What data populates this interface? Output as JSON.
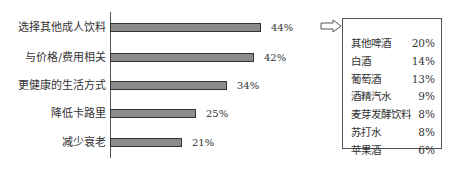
{
  "chart_data": {
    "type": "bar",
    "orientation": "horizontal",
    "categories": [
      "选择其他成人饮料",
      "与价格/费用相关",
      "更健康的生活方式",
      "降低卡路里",
      "减少衰老"
    ],
    "values": [
      44,
      42,
      34,
      25,
      21
    ],
    "value_labels": [
      "44%",
      "42%",
      "34%",
      "25%",
      "21%"
    ],
    "title": "",
    "xlabel": "",
    "ylabel": "",
    "xlim": [
      0,
      50
    ],
    "grid": false,
    "bar_color": "#8c8c8c",
    "annotation": {
      "arrow_from": "选择其他成人饮料",
      "table": [
        {
          "name": "其他啤酒",
          "value": "20%"
        },
        {
          "name": "白酒",
          "value": "14%"
        },
        {
          "name": "葡萄酒",
          "value": "13%"
        },
        {
          "name": "酒精汽水",
          "value": "9%"
        },
        {
          "name": "麦芽发酵饮料",
          "value": "8%"
        },
        {
          "name": "苏打水",
          "value": "8%"
        },
        {
          "name": "苹果酒",
          "value": "6%"
        }
      ]
    }
  }
}
